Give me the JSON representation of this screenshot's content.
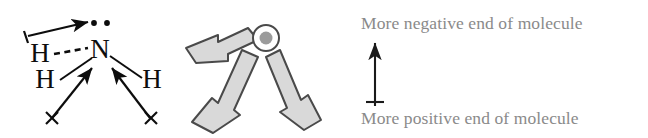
{
  "diagram": {
    "molecule": {
      "central_atom": "N",
      "central_atom_lone_pair_electrons": 2,
      "hydrogens": [
        {
          "label": "H",
          "position": "upper-left",
          "bond_style": "dashed"
        },
        {
          "label": "H",
          "position": "lower-left",
          "bond_style": "solid"
        },
        {
          "label": "H",
          "position": "right",
          "bond_style": "solid"
        }
      ],
      "bond_dipole_arrows": 3,
      "dipole_tail_symbol": "+",
      "dipole_cross_symbol": "×",
      "lone_pair_dipole_arrow_direction": "toward lone pair (up-right)"
    },
    "vector_sum": {
      "block_arrows": 3,
      "arrow_directions": [
        "from left (horizontal)",
        "from lower-left",
        "from lower-right"
      ],
      "convergence_marker": "net-dipole-circle",
      "arrow_fill_color": "#d9d9d9",
      "arrow_stroke_color": "#4a4a4a",
      "circle_dot_color": "#9b9b9b"
    },
    "legend": {
      "top_label": "More negative end of molecule",
      "bottom_label": "More positive end of molecule",
      "arrow": {
        "direction": "up",
        "has_tail_cross": true,
        "color": "#1a1a1a"
      },
      "text_color": "#8a8a8a"
    }
  }
}
